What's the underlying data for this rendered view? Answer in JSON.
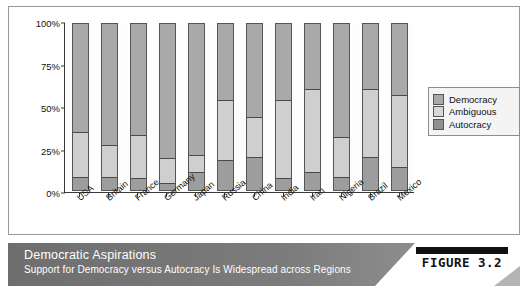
{
  "figure": {
    "badge_label": "FIGURE 3.2",
    "caption_title": "Democratic Aspirations",
    "caption_subtitle": "Support for Democracy versus Autocracy Is Widespread across Regions"
  },
  "legend": {
    "items": [
      {
        "label": "Democracy",
        "color": "#a9a9a9"
      },
      {
        "label": "Ambiguous",
        "color": "#d8d8d8"
      },
      {
        "label": "Autocracy",
        "color": "#8f8f8f"
      }
    ]
  },
  "chart_data": {
    "type": "bar",
    "stacked": true,
    "title": "Democratic Aspirations",
    "subtitle": "Support for Democracy versus Autocracy Is Widespread across Regions",
    "xlabel": "",
    "ylabel": "",
    "ylim": [
      0,
      100
    ],
    "yticks": [
      "0%",
      "25%",
      "50%",
      "75%",
      "100%"
    ],
    "ytick_values": [
      0,
      25,
      50,
      75,
      100
    ],
    "grid": false,
    "legend_position": "right",
    "categories": [
      "USA",
      "Britain",
      "France",
      "Germany",
      "Japan",
      "Russia",
      "China",
      "India",
      "Iran",
      "Nigeria",
      "Brazil",
      "Mexico"
    ],
    "series": [
      {
        "name": "Democracy",
        "values": [
          65,
          73,
          67,
          81,
          79,
          46,
          56,
          46,
          39,
          68,
          39,
          43
        ]
      },
      {
        "name": "Ambiguous",
        "values": [
          27,
          19,
          26,
          15,
          10,
          36,
          24,
          47,
          50,
          24,
          41,
          43
        ]
      },
      {
        "name": "Autocracy",
        "values": [
          8,
          8,
          7,
          4,
          11,
          18,
          20,
          7,
          11,
          8,
          20,
          14
        ]
      }
    ]
  }
}
